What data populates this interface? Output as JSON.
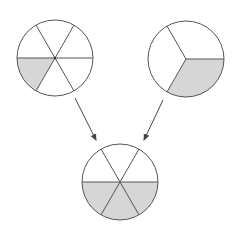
{
  "diagram": {
    "description": "Fraction addition: 1/6 + 1/3 = 1/2 shown with pie circles",
    "colors": {
      "stroke": "#555555",
      "fill_shaded": "#d6d6d6",
      "fill_empty": "#ffffff",
      "arrow": "#444444"
    },
    "circles": [
      {
        "id": "left",
        "label": "1/6",
        "cx": 55,
        "cy": 58,
        "r": 38,
        "divisions": 6,
        "shaded": 1
      },
      {
        "id": "right",
        "label": "1/3",
        "cx": 186,
        "cy": 59,
        "r": 38,
        "divisions": 3,
        "shaded": 1
      },
      {
        "id": "result",
        "label": "1/2",
        "cx": 120,
        "cy": 182,
        "r": 38,
        "divisions": 6,
        "shaded": 3
      }
    ],
    "arrows": [
      {
        "from": "left",
        "x1": 75,
        "y1": 98,
        "x2": 96,
        "y2": 140
      },
      {
        "from": "right",
        "x1": 163,
        "y1": 100,
        "x2": 144,
        "y2": 140
      }
    ]
  }
}
